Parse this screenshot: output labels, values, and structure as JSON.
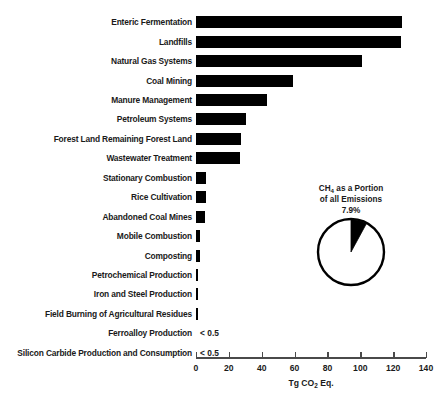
{
  "chart_data": {
    "type": "bar",
    "orientation": "horizontal",
    "title": "",
    "xlabel": "Tg CO2 Eq.",
    "ylabel": "",
    "xlim": [
      0,
      140
    ],
    "xticks": [
      0,
      20,
      40,
      60,
      80,
      100,
      120,
      140
    ],
    "grid": false,
    "legend": null,
    "categories": [
      "Enteric Fermentation",
      "Landfills",
      "Natural Gas Systems",
      "Coal Mining",
      "Manure Management",
      "Petroleum Systems",
      "Forest Land Remaining Forest Land",
      "Wastewater Treatment",
      "Stationary Combustion",
      "Rice Cultivation",
      "Abandoned Coal Mines",
      "Mobile Combustion",
      "Composting",
      "Petrochemical Production",
      "Iron and Steel Production",
      "Field Burning of Agricultural Residues",
      "Ferroalloy Production",
      "Silicon Carbide Production and Consumption"
    ],
    "values": [
      125.5,
      125.0,
      101.0,
      59.0,
      43.0,
      30.5,
      27.5,
      27.0,
      6.2,
      5.8,
      5.5,
      2.6,
      2.2,
      1.2,
      1.0,
      1.0,
      null,
      null
    ],
    "value_labels": [
      "",
      "",
      "",
      "",
      "",
      "",
      "",
      "",
      "",
      "",
      "",
      "",
      "",
      "",
      "",
      "",
      "< 0.5",
      "< 0.5"
    ],
    "bar_color": "#000000"
  },
  "pie_inset": {
    "caption_line1": "CH4 as a Portion",
    "caption_line2": "of all Emissions",
    "percent_label": "7.9%",
    "slice_value": 7.9,
    "remainder_value": 92.1,
    "slice_color": "#000000",
    "remainder_color": "#ffffff",
    "outline_color": "#000000"
  },
  "axis": {
    "tick_labels": [
      "0",
      "20",
      "40",
      "60",
      "80",
      "100",
      "120",
      "140"
    ],
    "unit_prefix": "Tg CO",
    "unit_sub": "2",
    "unit_suffix": " Eq."
  }
}
